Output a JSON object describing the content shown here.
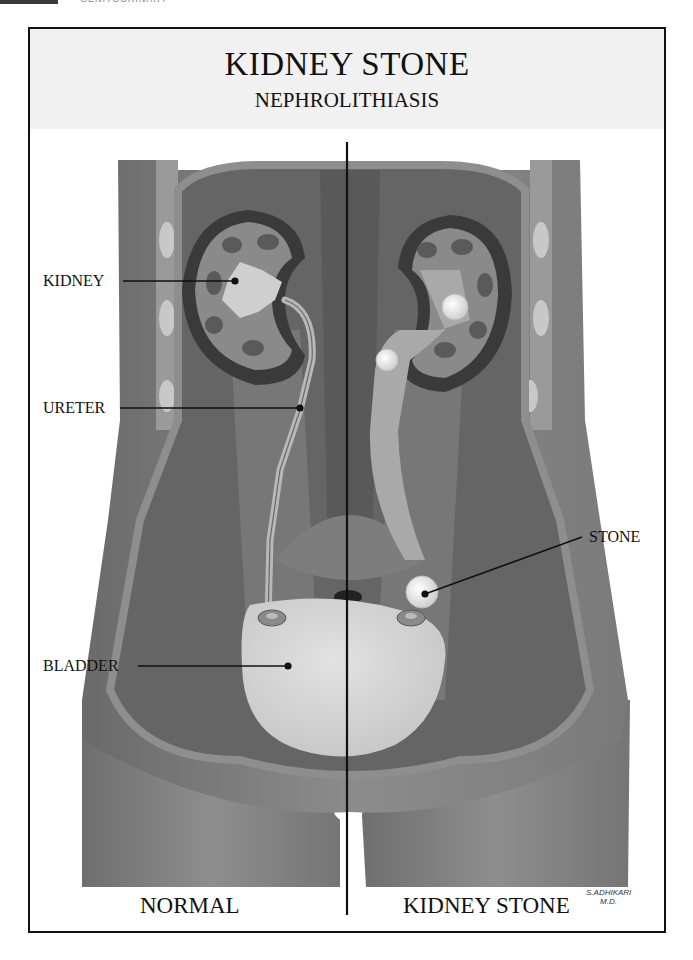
{
  "header": {
    "running_head": "GENITOURINARY",
    "title": "KIDNEY STONE",
    "subtitle": "NEPHROLITHIASIS"
  },
  "labels": {
    "kidney": "KIDNEY",
    "ureter": "URETER",
    "bladder": "BLADDER",
    "stone": "STONE"
  },
  "captions": {
    "left": "NORMAL",
    "right": "KIDNEY STONE"
  },
  "signature": {
    "name": "S.ADHIKARI",
    "credential": "M.D."
  },
  "colors": {
    "frame": "#111111",
    "title_band": "#f1f1f1",
    "skin": "#8a8a8a",
    "muscle": "#6f6f6f",
    "organ_light": "#d9d9d9",
    "stone": "#f2f2f2"
  }
}
